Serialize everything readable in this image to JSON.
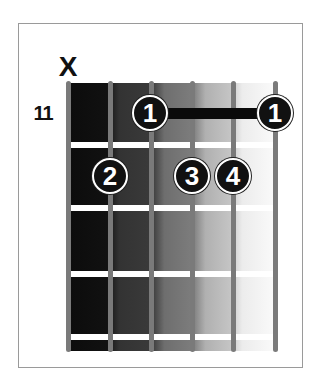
{
  "chord": {
    "muted_marker": "X",
    "start_fret_label": "11",
    "string_count": 6,
    "fret_rows": 4,
    "muted_strings": [
      1
    ],
    "barre": {
      "fret": 1,
      "from_string": 3,
      "to_string": 6,
      "finger": "1"
    },
    "fingers": [
      {
        "string": 3,
        "fret": 1,
        "finger": "1"
      },
      {
        "string": 6,
        "fret": 1,
        "finger": "1"
      },
      {
        "string": 2,
        "fret": 2,
        "finger": "2"
      },
      {
        "string": 4,
        "fret": 2,
        "finger": "3"
      },
      {
        "string": 5,
        "fret": 2,
        "finger": "4"
      }
    ]
  },
  "colors": {
    "string": "#7a7a7a",
    "fret": "#ffffff",
    "dot": "#111111",
    "dot_text": "#ffffff",
    "frame": "#9a9a9a"
  }
}
